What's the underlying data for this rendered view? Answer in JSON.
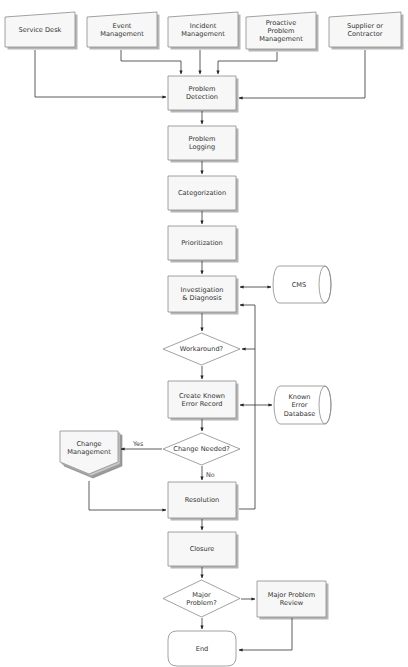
{
  "diagram": {
    "type": "flowchart",
    "title_visible": false,
    "colors": {
      "box_fill": "#f7f7f7",
      "box_stroke": "#8a8a8a",
      "shadow": "#a9a9a9",
      "line": "#333333",
      "text": "#333333"
    },
    "nodes": [
      {
        "id": "service-desk",
        "shape": "manual-input",
        "lines": [
          "Service Desk"
        ],
        "x": 5,
        "y": 12,
        "w": 70,
        "h": 35
      },
      {
        "id": "event-management",
        "shape": "manual-input",
        "lines": [
          "Event",
          "Management"
        ],
        "x": 87,
        "y": 12,
        "w": 70,
        "h": 35
      },
      {
        "id": "incident-management",
        "shape": "manual-input",
        "lines": [
          "Incident",
          "Management"
        ],
        "x": 168,
        "y": 12,
        "w": 70,
        "h": 35
      },
      {
        "id": "proactive-problem-management",
        "shape": "manual-input",
        "lines": [
          "Proactive",
          "Problem",
          "Management"
        ],
        "x": 246,
        "y": 12,
        "w": 70,
        "h": 37
      },
      {
        "id": "supplier-or-contractor",
        "shape": "manual-input",
        "lines": [
          "Supplier or",
          "Contractor"
        ],
        "x": 329,
        "y": 12,
        "w": 72,
        "h": 35
      },
      {
        "id": "problem-detection",
        "shape": "process",
        "lines": [
          "Problem",
          "Detection"
        ],
        "x": 168,
        "y": 76,
        "w": 68,
        "h": 34
      },
      {
        "id": "problem-logging",
        "shape": "process",
        "lines": [
          "Problem",
          "Logging"
        ],
        "x": 168,
        "y": 126,
        "w": 68,
        "h": 34
      },
      {
        "id": "categorization",
        "shape": "process",
        "lines": [
          "Categorization"
        ],
        "x": 168,
        "y": 176,
        "w": 68,
        "h": 34
      },
      {
        "id": "prioritization",
        "shape": "process",
        "lines": [
          "Prioritization"
        ],
        "x": 168,
        "y": 226,
        "w": 68,
        "h": 34
      },
      {
        "id": "investigation-diagnosis",
        "shape": "process",
        "lines": [
          "Investigation",
          "& Diagnosis"
        ],
        "x": 168,
        "y": 276,
        "w": 68,
        "h": 36
      },
      {
        "id": "cms",
        "shape": "cylinder",
        "lines": [
          "CMS"
        ],
        "x": 273,
        "y": 266,
        "w": 58,
        "h": 37
      },
      {
        "id": "workaround",
        "shape": "decision",
        "lines": [
          "Workaround?"
        ],
        "x": 163,
        "y": 333,
        "w": 77,
        "h": 32
      },
      {
        "id": "create-known-error-record",
        "shape": "process",
        "lines": [
          "Create Known",
          "Error Record"
        ],
        "x": 168,
        "y": 381,
        "w": 68,
        "h": 37
      },
      {
        "id": "known-error-database",
        "shape": "cylinder",
        "lines": [
          "Known",
          "Error",
          "Database"
        ],
        "x": 274,
        "y": 386,
        "w": 57,
        "h": 38
      },
      {
        "id": "change-needed",
        "shape": "decision",
        "lines": [
          "Change Needed?"
        ],
        "x": 163,
        "y": 433,
        "w": 77,
        "h": 32
      },
      {
        "id": "change-management",
        "shape": "multi-offpage",
        "lines": [
          "Change",
          "Management"
        ],
        "x": 60,
        "y": 431,
        "w": 58,
        "h": 43
      },
      {
        "id": "resolution",
        "shape": "process",
        "lines": [
          "Resolution"
        ],
        "x": 168,
        "y": 482,
        "w": 68,
        "h": 36
      },
      {
        "id": "closure",
        "shape": "process",
        "lines": [
          "Closure"
        ],
        "x": 168,
        "y": 532,
        "w": 68,
        "h": 34
      },
      {
        "id": "major-problem",
        "shape": "decision",
        "lines": [
          "Major",
          "Problem?"
        ],
        "x": 163,
        "y": 580,
        "w": 77,
        "h": 37
      },
      {
        "id": "major-problem-review",
        "shape": "process",
        "lines": [
          "Major Problem",
          "Review"
        ],
        "x": 257,
        "y": 581,
        "w": 69,
        "h": 36
      },
      {
        "id": "end",
        "shape": "terminator",
        "lines": [
          "End"
        ],
        "x": 168,
        "y": 631,
        "w": 68,
        "h": 35
      }
    ],
    "edges": [
      {
        "from": "service-desk",
        "to": "problem-detection",
        "points": [
          [
            35,
            50
          ],
          [
            35,
            97
          ],
          [
            166,
            97
          ]
        ],
        "arrow_end": true
      },
      {
        "from": "event-management",
        "to": "problem-detection",
        "points": [
          [
            121,
            50
          ],
          [
            121,
            61
          ],
          [
            181,
            61
          ],
          [
            181,
            74
          ]
        ],
        "arrow_end": true
      },
      {
        "from": "incident-management",
        "to": "problem-detection",
        "points": [
          [
            200,
            50
          ],
          [
            200,
            74
          ]
        ],
        "arrow_end": true
      },
      {
        "from": "proactive-problem-management",
        "to": "problem-detection",
        "points": [
          [
            277,
            52
          ],
          [
            277,
            61
          ],
          [
            218,
            61
          ],
          [
            218,
            74
          ]
        ],
        "arrow_end": true
      },
      {
        "from": "supplier-or-contractor",
        "to": "problem-detection",
        "points": [
          [
            365,
            50
          ],
          [
            365,
            98
          ],
          [
            239,
            98
          ]
        ],
        "arrow_end": true
      },
      {
        "from": "problem-detection",
        "to": "problem-logging",
        "points": [
          [
            202,
            111
          ],
          [
            202,
            124
          ]
        ],
        "arrow_end": true
      },
      {
        "from": "problem-logging",
        "to": "categorization",
        "points": [
          [
            202,
            161
          ],
          [
            202,
            174
          ]
        ],
        "arrow_end": true
      },
      {
        "from": "categorization",
        "to": "prioritization",
        "points": [
          [
            202,
            211
          ],
          [
            202,
            224
          ]
        ],
        "arrow_end": true
      },
      {
        "from": "prioritization",
        "to": "investigation-diagnosis",
        "points": [
          [
            202,
            261
          ],
          [
            202,
            274
          ]
        ],
        "arrow_end": true
      },
      {
        "from": "investigation-diagnosis",
        "to": "cms",
        "points": [
          [
            240,
            287
          ],
          [
            271,
            287
          ]
        ],
        "arrow_end": true,
        "arrow_start": true
      },
      {
        "from": "investigation-diagnosis",
        "to": "workaround",
        "points": [
          [
            202,
            313
          ],
          [
            202,
            331
          ]
        ],
        "arrow_end": true
      },
      {
        "from": "workaround",
        "to": "create-known-error-record",
        "points": [
          [
            202,
            366
          ],
          [
            202,
            379
          ]
        ],
        "arrow_end": true
      },
      {
        "from": "create-known-error-record",
        "to": "known-error-database",
        "points": [
          [
            240,
            405
          ],
          [
            272,
            405
          ]
        ],
        "arrow_end": true,
        "arrow_start": true
      },
      {
        "from": "create-known-error-record",
        "to": "change-needed",
        "points": [
          [
            202,
            419
          ],
          [
            202,
            431
          ]
        ],
        "arrow_end": true
      },
      {
        "from": "change-needed",
        "to": "change-management",
        "label": "Yes",
        "label_pos": [
          133,
          446
        ],
        "points": [
          [
            162,
            449
          ],
          [
            121,
            449
          ]
        ],
        "arrow_end": true
      },
      {
        "from": "change-needed",
        "to": "resolution",
        "label": "No",
        "label_pos": [
          206,
          477
        ],
        "points": [
          [
            202,
            466
          ],
          [
            202,
            480
          ]
        ],
        "arrow_end": true
      },
      {
        "from": "change-management",
        "to": "resolution",
        "points": [
          [
            89,
            481
          ],
          [
            89,
            510
          ],
          [
            166,
            510
          ]
        ],
        "arrow_end": true
      },
      {
        "from": "resolution",
        "to": "investigation-diagnosis",
        "points": [
          [
            239,
            509
          ],
          [
            255,
            509
          ],
          [
            255,
            305
          ],
          [
            240,
            305
          ]
        ],
        "arrow_end": true
      },
      {
        "from": "feedback-loop",
        "to": "workaround",
        "points": [
          [
            255,
            349
          ],
          [
            242,
            349
          ]
        ],
        "arrow_end": true
      },
      {
        "from": "resolution",
        "to": "closure",
        "points": [
          [
            202,
            519
          ],
          [
            202,
            530
          ]
        ],
        "arrow_end": true
      },
      {
        "from": "closure",
        "to": "major-problem",
        "points": [
          [
            202,
            567
          ],
          [
            202,
            578
          ]
        ],
        "arrow_end": true
      },
      {
        "from": "major-problem",
        "to": "major-problem-review",
        "points": [
          [
            241,
            599
          ],
          [
            255,
            599
          ]
        ],
        "arrow_end": true
      },
      {
        "from": "major-problem",
        "to": "end",
        "points": [
          [
            202,
            618
          ],
          [
            202,
            629
          ]
        ],
        "arrow_end": true
      },
      {
        "from": "major-problem-review",
        "to": "end",
        "points": [
          [
            292,
            618
          ],
          [
            292,
            650
          ],
          [
            239,
            650
          ]
        ],
        "arrow_end": true
      }
    ]
  }
}
